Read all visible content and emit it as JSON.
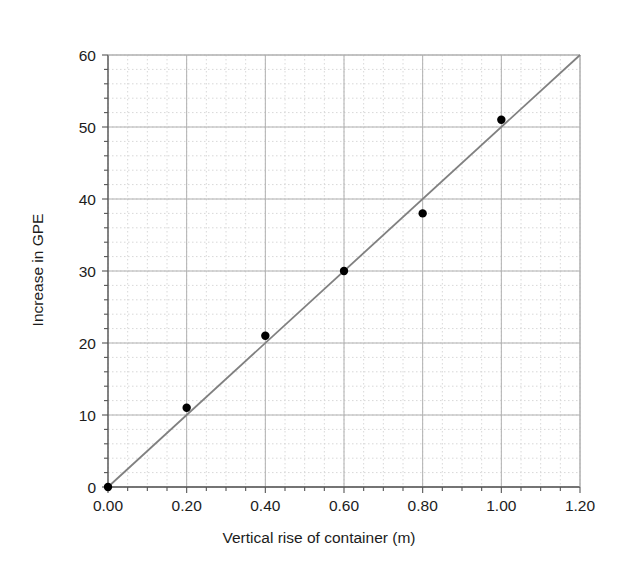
{
  "chart_data": {
    "type": "scatter",
    "title": "",
    "xlabel": "Vertical rise of container (m)",
    "ylabel": "Increase in GPE",
    "xlim": [
      0.0,
      1.2
    ],
    "ylim": [
      0,
      60
    ],
    "x_ticks": [
      "0.00",
      "0.20",
      "0.40",
      "0.60",
      "0.80",
      "1.00",
      "1.20"
    ],
    "x_tick_values": [
      0.0,
      0.2,
      0.4,
      0.6,
      0.8,
      1.0,
      1.2
    ],
    "y_ticks": [
      "0",
      "10",
      "20",
      "30",
      "40",
      "50",
      "60"
    ],
    "y_tick_values": [
      0,
      10,
      20,
      30,
      40,
      50,
      60
    ],
    "x_minor_step": 0.05,
    "y_minor_step": 2,
    "grid": "major-solid-minor-dotted",
    "legend": "none",
    "x": [
      0.0,
      0.2,
      0.4,
      0.6,
      0.8,
      1.0
    ],
    "values": [
      0,
      11,
      21,
      30,
      38,
      51
    ],
    "points": [
      {
        "x": 0.0,
        "y": 0
      },
      {
        "x": 0.2,
        "y": 11
      },
      {
        "x": 0.4,
        "y": 21
      },
      {
        "x": 0.6,
        "y": 30
      },
      {
        "x": 0.8,
        "y": 38
      },
      {
        "x": 1.0,
        "y": 51
      }
    ],
    "series": [
      {
        "name": "Increase in GPE",
        "marker": "filled-circle",
        "marker_color": "#000000",
        "values": [
          0,
          11,
          21,
          30,
          38,
          51
        ]
      },
      {
        "name": "line of best fit",
        "type": "line",
        "color": "#808080",
        "from": {
          "x": 0.0,
          "y": 0
        },
        "to": {
          "x": 1.2,
          "y": 60
        },
        "slope": 50
      }
    ],
    "colors": {
      "marker": "#000000",
      "trend_line": "#808080",
      "axis": "#555555",
      "major_grid": "#b0b0b0",
      "minor_grid": "#d8d8d8",
      "text": "#1c1c1c",
      "background": "#ffffff"
    }
  }
}
